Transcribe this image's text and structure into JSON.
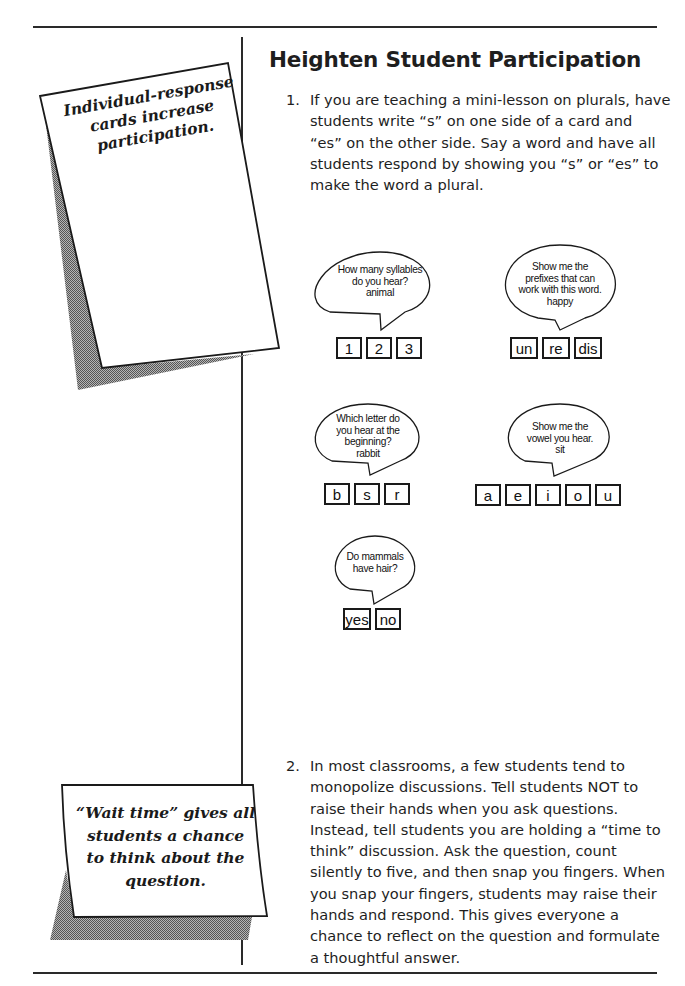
{
  "page": {
    "title": "Heighten Student Participation",
    "items": [
      {
        "number": "1.",
        "lines": [
          "If you are teaching a mini-lesson on plurals, have",
          "students write “s” on one side of a card and",
          "“es” on the other side. Say a word and have all",
          "students respond by showing you “s” or “es” to",
          "make the word a plural."
        ]
      },
      {
        "number": "2.",
        "lines": [
          "In most classrooms, a few students tend to",
          "monopolize discussions. Tell students NOT to",
          "raise their hands when you ask questions.",
          "Instead, tell students you are holding a “time to",
          "think” discussion. Ask the question, count",
          "silently to five, and then snap you fingers. When",
          "you snap your fingers, students may raise their",
          "hands and respond. This gives everyone a",
          "chance to reflect on the question and formulate",
          "a thoughtful answer."
        ]
      }
    ]
  },
  "examples": [
    {
      "bubble": [
        "How many syllables",
        "do you hear?",
        "animal"
      ],
      "cards": [
        "1",
        "2",
        "3"
      ]
    },
    {
      "bubble": [
        "Show me the",
        "prefixes that can",
        "work with this word.",
        "happy"
      ],
      "cards": [
        "un",
        "re",
        "dis"
      ]
    },
    {
      "bubble": [
        "Which letter do",
        "you hear at the",
        "beginning?",
        "rabbit"
      ],
      "cards": [
        "b",
        "s",
        "r"
      ]
    },
    {
      "bubble": [
        "Show me the",
        "vowel you hear.",
        "sit"
      ],
      "cards": [
        "a",
        "e",
        "i",
        "o",
        "u"
      ]
    },
    {
      "bubble": [
        "Do mammals",
        "have hair?"
      ],
      "cards": [
        "yes",
        "no"
      ]
    }
  ],
  "sidebar_notes": [
    {
      "lines": [
        "Individual-response",
        "cards increase",
        "participation."
      ]
    },
    {
      "lines": [
        "“Wait time” gives all",
        "students a chance",
        "to think about the",
        "question."
      ]
    }
  ],
  "colors": {
    "rule": "#2a2a2a",
    "shadow": "#8a8a8a"
  }
}
